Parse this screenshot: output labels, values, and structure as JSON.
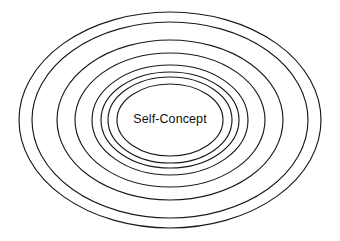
{
  "diagram": {
    "kind": "concentric-ellipse-diagram",
    "title": "Self-Concept",
    "background_color": "#ffffff",
    "stroke_color": "#1a1a1a",
    "label_color": "#111111",
    "center": {
      "x": 170,
      "y": 120
    },
    "center_label": "Self-Concept",
    "ring_count": 8,
    "rings": [
      {
        "index": 1,
        "name": "ring-outer-1",
        "rx": 151,
        "ry": 108
      },
      {
        "index": 2,
        "name": "ring-outer-2",
        "rx": 138,
        "ry": 98
      },
      {
        "index": 3,
        "name": "ring-middle-3",
        "rx": 113,
        "ry": 80
      },
      {
        "index": 4,
        "name": "ring-middle-4",
        "rx": 95,
        "ry": 67
      },
      {
        "index": 5,
        "name": "ring-inner-5",
        "rx": 78,
        "ry": 55
      },
      {
        "index": 6,
        "name": "ring-inner-6",
        "rx": 69,
        "ry": 48
      },
      {
        "index": 7,
        "name": "ring-inner-7",
        "rx": 62,
        "ry": 43
      },
      {
        "index": 8,
        "name": "ring-core-8",
        "rx": 53,
        "ry": 36
      }
    ]
  },
  "chart_data": {
    "type": "diagram",
    "subtype": "concentric-ellipses",
    "title": "Self-Concept",
    "xlabel": "",
    "ylabel": "",
    "categories": [
      "ring-outer-1",
      "ring-outer-2",
      "ring-middle-3",
      "ring-middle-4",
      "ring-inner-5",
      "ring-inner-6",
      "ring-inner-7",
      "ring-core-8"
    ],
    "series": [
      {
        "name": "semi-axis-x",
        "values": [
          151,
          138,
          113,
          95,
          78,
          69,
          62,
          53
        ]
      },
      {
        "name": "semi-axis-y",
        "values": [
          108,
          98,
          80,
          67,
          55,
          48,
          43,
          36
        ]
      }
    ],
    "annotations": [
      {
        "text": "Self-Concept",
        "x": 170,
        "y": 120
      }
    ],
    "legend": [],
    "grid": false
  }
}
